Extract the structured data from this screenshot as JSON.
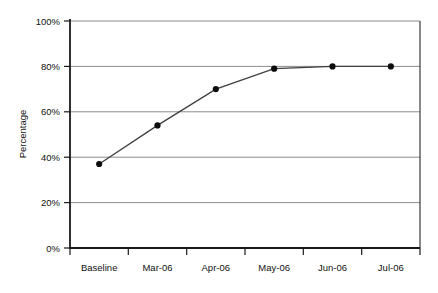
{
  "chart_data": {
    "type": "line",
    "title": "",
    "xlabel": "",
    "ylabel": "Percentage",
    "categories": [
      "Baseline",
      "Mar-06",
      "Apr-06",
      "May-06",
      "Jun-06",
      "Jul-06"
    ],
    "values": [
      37,
      54,
      70,
      79,
      80,
      80
    ],
    "series": [
      {
        "name": "Percentage",
        "values": [
          37,
          54,
          70,
          79,
          80,
          80
        ]
      }
    ],
    "ylim": [
      0,
      100
    ],
    "ytick_labels": [
      "0%",
      "20%",
      "40%",
      "60%",
      "80%",
      "100%"
    ],
    "ytick_values": [
      0,
      20,
      40,
      60,
      80,
      100
    ],
    "grid": true,
    "grid_axis": "y",
    "legend": "none",
    "marker": "filled-circle",
    "colors": {
      "line": "#3f3f3f",
      "marker": "#0d0d0d",
      "gridline": "#999999",
      "axis": "#1a1a1a",
      "plot_background": "#ffffff",
      "figure_background": "#ffffff"
    }
  }
}
